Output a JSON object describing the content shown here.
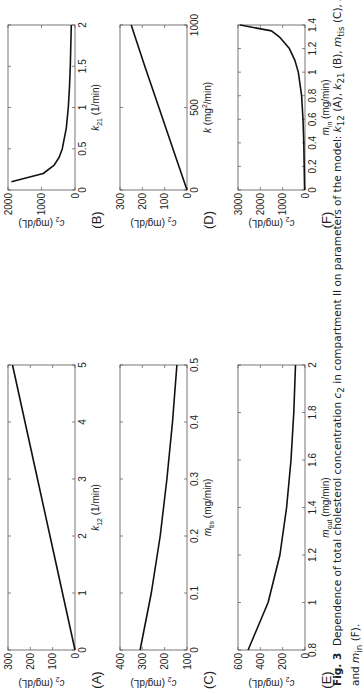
{
  "figure": {
    "label": "Fig. 3",
    "caption_text": "Dependence of total cholesterol concentration c2 in compartment II on parameters of the model: k12 (A), k21 (B), mtis (C), k (D), mout (E),",
    "caption_line2": "and min (F).",
    "caption_parts": {
      "p1": "Dependence of total cholesterol concentration ",
      "c": "c",
      "c_sub": "2",
      "p2": " in compartment II on parameters of the model: ",
      "k12": "k",
      "k12_sub": "12",
      "a": " (A), ",
      "k21": "k",
      "k21_sub": "21",
      "b": " (B), ",
      "mtis": "m",
      "mtis_sub": "tis",
      "c_lbl": " (C), ",
      "k": "k",
      "d": " (D), ",
      "mout": "m",
      "mout_sub": "out",
      "e": " (E),",
      "line2_pre": "and ",
      "min": "m",
      "min_sub": "in",
      "f": " (F)."
    }
  },
  "chart_data": [
    {
      "panel": "A",
      "type": "line",
      "xlabel": "k12 (1/min)",
      "ylabel": "c2 (mg/dL)",
      "xlim": [
        0,
        5
      ],
      "ylim": [
        0,
        300
      ],
      "xticks": [
        0,
        1,
        2,
        3,
        4,
        5
      ],
      "yticks": [
        0,
        100,
        200,
        300
      ],
      "x": [
        0,
        1,
        2,
        3,
        4,
        5
      ],
      "y": [
        0,
        56,
        112,
        168,
        224,
        280
      ]
    },
    {
      "panel": "B",
      "type": "line",
      "xlabel": "k21 (1/min)",
      "ylabel": "c2 (mg/dL)",
      "xlim": [
        0,
        2
      ],
      "ylim": [
        0,
        2000
      ],
      "xticks": [
        0,
        0.5,
        1,
        1.5,
        2
      ],
      "yticks": [
        0,
        1000,
        2000
      ],
      "x": [
        0.1,
        0.2,
        0.3,
        0.4,
        0.5,
        0.75,
        1.0,
        1.25,
        1.5,
        1.75,
        2.0
      ],
      "y": [
        1900,
        950,
        620,
        470,
        380,
        260,
        200,
        165,
        140,
        125,
        110
      ]
    },
    {
      "panel": "C",
      "type": "line",
      "xlabel": "mtis (mg/min)",
      "ylabel": "c2 (mg/dL)",
      "xlim": [
        0,
        0.5
      ],
      "ylim": [
        100,
        400
      ],
      "xticks": [
        0,
        0.1,
        0.2,
        0.3,
        0.4,
        0.5
      ],
      "yticks": [
        100,
        200,
        300,
        400
      ],
      "x": [
        0,
        0.1,
        0.2,
        0.3,
        0.4,
        0.5
      ],
      "y": [
        310,
        260,
        220,
        190,
        165,
        145
      ]
    },
    {
      "panel": "D",
      "type": "line",
      "xlabel": "k (mg2/min)",
      "ylabel": "c2 (mg/dL)",
      "xlim": [
        0,
        1000
      ],
      "ylim": [
        0,
        300
      ],
      "xticks": [
        0,
        500,
        1000
      ],
      "yticks": [
        0,
        100,
        200,
        300
      ],
      "x": [
        0,
        250,
        500,
        750,
        1000
      ],
      "y": [
        0,
        63,
        126,
        189,
        250
      ]
    },
    {
      "panel": "E",
      "type": "line",
      "xlabel": "mout (mg/min)",
      "ylabel": "c2 (mg/dL)",
      "xlim": [
        0.8,
        2
      ],
      "ylim": [
        0,
        600
      ],
      "xticks": [
        0.8,
        1,
        1.2,
        1.4,
        1.6,
        1.8,
        2
      ],
      "yticks": [
        0,
        200,
        400,
        600
      ],
      "x": [
        0.8,
        1.0,
        1.2,
        1.4,
        1.6,
        1.8,
        2.0
      ],
      "y": [
        510,
        330,
        225,
        165,
        125,
        100,
        85
      ]
    },
    {
      "panel": "F",
      "type": "line",
      "xlabel": "min (mg/min)",
      "ylabel": "c2 (mg/dL)",
      "xlim": [
        0,
        1.4
      ],
      "ylim": [
        0,
        3000
      ],
      "xticks": [
        0,
        0.2,
        0.4,
        0.6,
        0.8,
        1,
        1.2,
        1.4
      ],
      "yticks": [
        0,
        1000,
        2000,
        3000
      ],
      "x": [
        0,
        0.2,
        0.4,
        0.6,
        0.8,
        1.0,
        1.1,
        1.2,
        1.3,
        1.35,
        1.4
      ],
      "y": [
        20,
        35,
        55,
        90,
        150,
        300,
        450,
        700,
        1150,
        1500,
        2900
      ]
    }
  ],
  "panels": {
    "A": {
      "letter": "(A)",
      "ylabel": "c",
      "ylabel_sub": "2",
      "ylabel_unit": " (mg/dL)",
      "xlabel": "k",
      "xlabel_sub": "12",
      "xlabel_unit": " (1/min)"
    },
    "B": {
      "letter": "(B)",
      "ylabel": "c",
      "ylabel_sub": "2",
      "ylabel_unit": " (mg/dL)",
      "xlabel": "k",
      "xlabel_sub": "21",
      "xlabel_unit": " (1/min)"
    },
    "C": {
      "letter": "(C)",
      "ylabel": "c",
      "ylabel_sub": "2",
      "ylabel_unit": " (mg/dL)",
      "xlabel": "m",
      "xlabel_sub": "tis",
      "xlabel_unit": " (mg/min)"
    },
    "D": {
      "letter": "(D)",
      "ylabel": "c",
      "ylabel_sub": "2",
      "ylabel_unit": " (mg/dL)",
      "xlabel": "k",
      "xlabel_sup": "2",
      "xlabel_unit": " (mg",
      "xlabel_unit2": "/min)"
    },
    "E": {
      "letter": "(E)",
      "ylabel": "c",
      "ylabel_sub": "2",
      "ylabel_unit": " (mg/dL)",
      "xlabel": "m",
      "xlabel_sub": "out",
      "xlabel_unit": " (mg/min)"
    },
    "F": {
      "letter": "(F)",
      "ylabel": "c",
      "ylabel_sub": "2",
      "ylabel_unit": " (mg/dL)",
      "xlabel": "m",
      "xlabel_sub": "in",
      "xlabel_unit": " (mg/min)"
    }
  },
  "style": {
    "line_color": "#111111",
    "frame_color": "#555555"
  }
}
